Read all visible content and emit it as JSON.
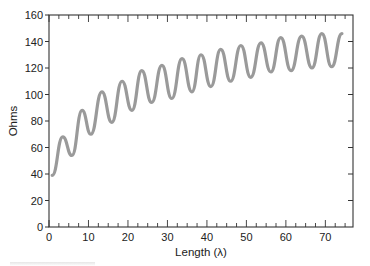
{
  "chart_data": {
    "type": "line",
    "title": "",
    "xlabel": "Length (λ)",
    "ylabel": "Ohms",
    "xlim": [
      0,
      77
    ],
    "ylim": [
      0,
      160
    ],
    "x_ticks": [
      0,
      10,
      20,
      30,
      40,
      50,
      60,
      70
    ],
    "y_ticks": [
      0,
      20,
      40,
      60,
      80,
      100,
      120,
      140,
      160
    ],
    "x_minor_step": 2.5,
    "grid": false,
    "legend": null,
    "line_color": "#9a9a9a",
    "series": [
      {
        "name": "Impedance",
        "x": [
          0.8,
          3.5,
          5.8,
          8.4,
          10.6,
          13.4,
          15.9,
          18.5,
          21.0,
          23.5,
          26.0,
          28.6,
          31.1,
          33.7,
          36.2,
          38.5,
          41.0,
          43.5,
          46.0,
          48.6,
          51.1,
          53.7,
          56.2,
          58.7,
          61.3,
          64.0,
          66.6,
          69.1,
          71.6,
          74.2
        ],
        "values": [
          39,
          68,
          54,
          88,
          70,
          102,
          79,
          110,
          88,
          118,
          94,
          122,
          97,
          127,
          102,
          130,
          106,
          134,
          110,
          137,
          113,
          139,
          117,
          143,
          118,
          144,
          120,
          146,
          121,
          146
        ]
      }
    ]
  }
}
